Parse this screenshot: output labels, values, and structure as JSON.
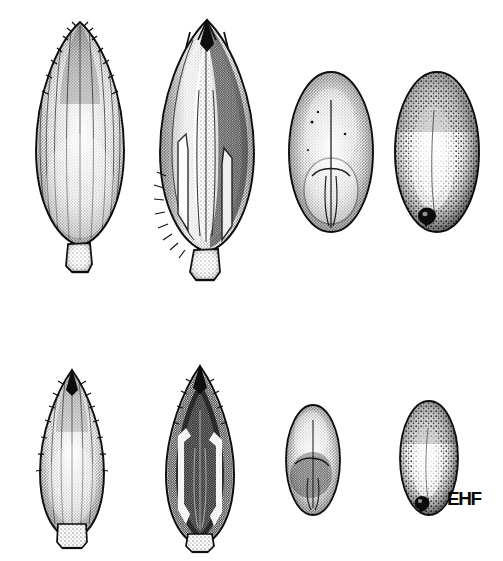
{
  "plate": {
    "title": "Grass spikelet and caryopsis illustration plate",
    "medium": "pen-and-ink stipple drawing",
    "background_color": "#ffffff",
    "ink_color": "#111111",
    "width": 503,
    "height": 561,
    "rows": 2,
    "columns": 4,
    "signature": "EHF",
    "signature_position": {
      "x": 447,
      "y": 489
    }
  },
  "specimens": [
    {
      "id": "top-spikelet-ventral",
      "row": 1,
      "column": 1,
      "label": "Spikelet, ventral view",
      "description": "Large ovate-lanceolate spikelet with longitudinal ribs, acute scabrous apex and a short stipe at the base",
      "bbox": {
        "x": 30,
        "y": 20,
        "width": 100,
        "height": 245
      },
      "shading": "medium stipple, lighter along central midrib",
      "features": [
        "longitudinal ribs",
        "scabrous apex teeth",
        "basal stipe",
        "acute tip"
      ]
    },
    {
      "id": "top-spikelet-opened",
      "row": 1,
      "column": 2,
      "label": "Spikelet, opened to show florets",
      "description": "Spikelet with glumes spread apart revealing the dark inner floret, pale lemma margins and ciliate lower edge",
      "bbox": {
        "x": 155,
        "y": 18,
        "width": 105,
        "height": 250
      },
      "shading": "high contrast, dark interior with pale lemma keel",
      "features": [
        "separated glume tips",
        "dark inner floret",
        "pale lemma margins",
        "ciliate margin hairs",
        "basal stipe"
      ]
    },
    {
      "id": "top-caryopsis-ventral",
      "row": 1,
      "column": 3,
      "label": "Caryopsis, ventral view",
      "description": "Broadly ovate grain showing the embryo scutellum as a rounded pale area in the lower half with a median groove",
      "bbox": {
        "x": 289,
        "y": 70,
        "width": 85,
        "height": 165
      },
      "shading": "even fine stipple, darker at margins",
      "features": [
        "embryo scutellum",
        "median groove",
        "rounded apex"
      ]
    },
    {
      "id": "top-caryopsis-dorsal",
      "row": 1,
      "column": 4,
      "label": "Caryopsis, dorsal view",
      "description": "Broadly ovate grain, dorsal face with coarse stipple and a dark hilum spot at the base",
      "bbox": {
        "x": 395,
        "y": 70,
        "width": 85,
        "height": 165
      },
      "shading": "coarse stipple with pale central highlight",
      "features": [
        "dark hilum spot",
        "coarse dorsal stipple",
        "pale central highlight"
      ]
    },
    {
      "id": "bottom-spikelet-ventral",
      "row": 2,
      "column": 1,
      "label": "Spikelet, ventral view (smaller form)",
      "description": "Narrow lanceolate spikelet with serrate-ciliate margins, long acuminate tip and a small truncate base",
      "bbox": {
        "x": 35,
        "y": 368,
        "width": 75,
        "height": 175
      },
      "shading": "medium stipple with pale midline",
      "features": [
        "serrate-ciliate margins",
        "acuminate apex",
        "truncate base"
      ]
    },
    {
      "id": "bottom-spikelet-opened",
      "row": 2,
      "column": 2,
      "label": "Spikelet, opened (smaller form)",
      "description": "Narrow spikelet opened to show a dark interior framed by two pale hook-shaped lemma margins",
      "bbox": {
        "x": 163,
        "y": 363,
        "width": 75,
        "height": 185
      },
      "shading": "very dark interior with bright pale lemma outlines",
      "features": [
        "dark interior cavity",
        "pale hook-shaped lemma margins",
        "acuminate apex"
      ]
    },
    {
      "id": "bottom-caryopsis-ventral",
      "row": 2,
      "column": 3,
      "label": "Caryopsis, ventral view (smaller form)",
      "description": "Small ovate grain with the embryo visible as a darker textured patch in the lower half",
      "bbox": {
        "x": 286,
        "y": 405,
        "width": 55,
        "height": 110
      },
      "shading": "fine stipple, darker toward base",
      "features": [
        "embryo patch",
        "median groove",
        "rounded apex"
      ]
    },
    {
      "id": "bottom-caryopsis-dorsal",
      "row": 2,
      "column": 4,
      "label": "Caryopsis, dorsal view (smaller form)",
      "description": "Small ovate grain, dorsal face with a dark hilum spot at the base, adjacent to the artist monogram",
      "bbox": {
        "x": 400,
        "y": 400,
        "width": 58,
        "height": 115
      },
      "shading": "coarse stipple with pale centre",
      "features": [
        "dark hilum spot",
        "coarse dorsal stipple"
      ]
    }
  ]
}
